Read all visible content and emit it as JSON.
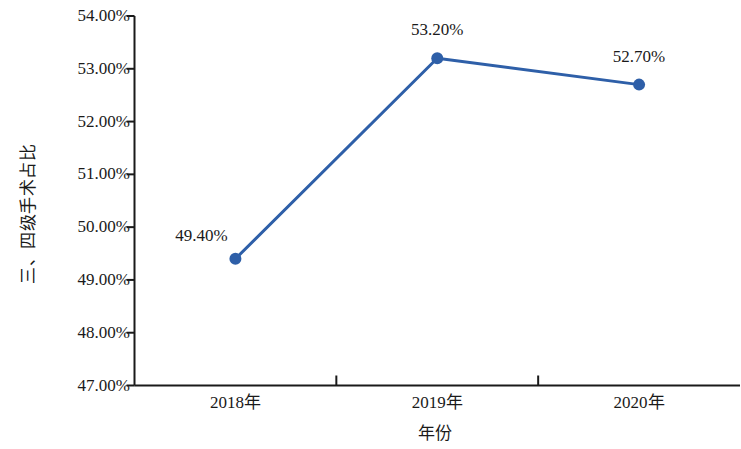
{
  "chart_data": {
    "type": "line",
    "title": "",
    "subtitle": "",
    "xlabel": "年份",
    "ylabel": "三、四级手术占比",
    "categories": [
      "2018年",
      "2019年",
      "2020年"
    ],
    "values": [
      49.4,
      52.7,
      53.2
    ],
    "series": [
      {
        "name": "三、四级手术占比",
        "values": [
          49.4,
          53.2,
          52.7
        ],
        "point_labels": [
          "49.40%",
          "53.20%",
          "52.70%"
        ],
        "color": "#2E5FA8",
        "marker": "circle"
      }
    ],
    "ylim": [
      47.0,
      54.0
    ],
    "ytick_values": [
      54.0,
      53.0,
      52.0,
      51.0,
      50.0,
      49.0,
      48.0,
      47.0
    ],
    "ytick_labels": [
      "54.00%",
      "53.00%",
      "52.00%",
      "51.00%",
      "50.00%",
      "49.00%",
      "48.00%",
      "47.00%"
    ],
    "grid": false,
    "legend": false,
    "legend_position": "none",
    "axis_color": "#1a1a1a",
    "background_color": "#ffffff"
  },
  "axes": {
    "y_title": "三、四级手术占比",
    "x_title": "年份"
  },
  "y_ticks": [
    {
      "label": "54.00%",
      "value": 54.0
    },
    {
      "label": "53.00%",
      "value": 53.0
    },
    {
      "label": "52.00%",
      "value": 52.0
    },
    {
      "label": "51.00%",
      "value": 51.0
    },
    {
      "label": "50.00%",
      "value": 50.0
    },
    {
      "label": "49.00%",
      "value": 49.0
    },
    {
      "label": "48.00%",
      "value": 48.0
    },
    {
      "label": "47.00%",
      "value": 47.0
    }
  ],
  "x_ticks": [
    {
      "label": "2018年"
    },
    {
      "label": "2019年"
    },
    {
      "label": "2020年"
    }
  ],
  "points": [
    {
      "label": "49.40%",
      "value": 49.4,
      "category": "2018年"
    },
    {
      "label": "53.20%",
      "value": 53.2,
      "category": "2019年"
    },
    {
      "label": "52.70%",
      "value": 52.7,
      "category": "2020年"
    }
  ],
  "colors": {
    "series": "#2E5FA8",
    "axis": "#1a1a1a",
    "text": "#1a1a1a",
    "background": "#ffffff"
  }
}
